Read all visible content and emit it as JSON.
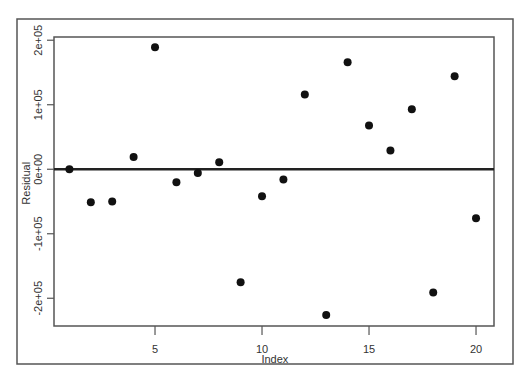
{
  "chart_data": {
    "type": "scatter",
    "title": "",
    "xlabel": "Index",
    "ylabel": "Residual",
    "xlim": [
      0.28,
      20.84
    ],
    "ylim": [
      -243000,
      205000
    ],
    "grid": false,
    "legend": null,
    "x_ticks": [
      5,
      10,
      15,
      20
    ],
    "x_tick_labels": [
      "5",
      "10",
      "15",
      "20"
    ],
    "y_ticks": [
      -200000,
      -100000,
      0,
      100000,
      200000
    ],
    "y_tick_labels": [
      "-2e+05",
      "-1e+05",
      "0e+00",
      "1e+05",
      "2e+05"
    ],
    "reference_line": {
      "type": "horizontal",
      "y": 0,
      "color": "#222222",
      "width": 2.5
    },
    "series": [
      {
        "name": "Residuals",
        "color": "#111111",
        "marker": "circle",
        "x": [
          1,
          2,
          3,
          4,
          5,
          6,
          7,
          8,
          9,
          10,
          11,
          12,
          13,
          14,
          15,
          16,
          17,
          18,
          19,
          20
        ],
        "y": [
          0,
          -51000,
          -50000,
          19000,
          189000,
          -20000,
          -6000,
          11000,
          -175000,
          -42000,
          -16000,
          116000,
          -226000,
          166000,
          68000,
          29000,
          93000,
          -191000,
          144000,
          -76000
        ]
      }
    ]
  },
  "frame": {
    "outer": {
      "x": 17,
      "y": 19,
      "w": 496,
      "h": 345,
      "color": "#555555"
    },
    "plot": {
      "x": 54,
      "y": 37,
      "w": 440,
      "h": 289,
      "color": "#555555"
    }
  }
}
